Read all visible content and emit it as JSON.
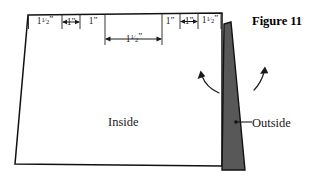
{
  "figure": {
    "title": "Figure 11",
    "inside_label": "Inside",
    "outside_label": "Outside",
    "colors": {
      "outline": "#111111",
      "wedge_fill": "#585858",
      "wedge_stroke": "#111111",
      "background": "#ffffff",
      "text": "#1a1a1a"
    }
  },
  "dimensions": {
    "top_row": [
      {
        "id": "dim-1",
        "whole": "1",
        "fraction": "1/2",
        "unit": "\"",
        "display": "1½\"",
        "x_center": 45,
        "has_arrows": false
      },
      {
        "id": "dim-2",
        "whole": "1",
        "fraction": "",
        "unit": "\"",
        "display": "1\"",
        "x_center": 71,
        "has_arrows": true
      },
      {
        "id": "dim-3",
        "whole": "1",
        "fraction": "",
        "unit": "\"",
        "display": "1\"",
        "x_center": 93,
        "has_arrows": false
      },
      {
        "id": "dim-5",
        "whole": "1",
        "fraction": "",
        "unit": "\"",
        "display": "1\"",
        "x_center": 168,
        "has_arrows": false
      },
      {
        "id": "dim-6",
        "whole": "1",
        "fraction": "",
        "unit": "\"",
        "display": "1\"",
        "x_center": 189,
        "has_arrows": true
      },
      {
        "id": "dim-7",
        "whole": "1",
        "fraction": "1/2",
        "unit": "\"",
        "display": "1½\"",
        "x_center": 211,
        "has_arrows": false
      }
    ],
    "center_row": [
      {
        "id": "dim-4",
        "whole": "1",
        "fraction": "1/2",
        "unit": "\"",
        "display": "1½\"",
        "x_center": 134,
        "y": 42,
        "has_arrows": true
      }
    ]
  },
  "ticks": {
    "top_edge_x": [
      28,
      62,
      80,
      105,
      162,
      180,
      198,
      220
    ]
  },
  "arrows": {
    "rotation_left": {
      "name": "rotate-inside-arrow",
      "direction": "counterclockwise-up-left"
    },
    "rotation_right": {
      "name": "rotate-outside-arrow",
      "direction": "clockwise-up-right"
    }
  }
}
